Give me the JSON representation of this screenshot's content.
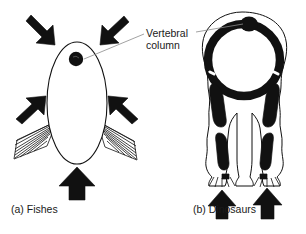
{
  "figure": {
    "background_color": "#ffffff",
    "ink_color": "#111111",
    "leader_line_color": "#7a7a7a",
    "annotation": {
      "name": "vertebral-column-label",
      "line1": "Vertebral",
      "line2": "column"
    },
    "panels": [
      {
        "id": "a",
        "caption": "(a) Fishes",
        "subject": "fish-cross-section",
        "body_shape": "ellipse-outline",
        "vertebral_column_marker": "filled-circle",
        "fins": [
          "left-pectoral-fin",
          "right-pectoral-fin"
        ],
        "force_arrows": [
          {
            "name": "arrow-top-left",
            "direction": "down-right",
            "fill": "#111111"
          },
          {
            "name": "arrow-top-right",
            "direction": "down-left",
            "fill": "#111111"
          },
          {
            "name": "arrow-mid-left",
            "direction": "up-right",
            "fill": "#111111"
          },
          {
            "name": "arrow-mid-right",
            "direction": "up-left",
            "fill": "#111111"
          },
          {
            "name": "arrow-bottom-center",
            "direction": "up",
            "fill": "#111111"
          }
        ]
      },
      {
        "id": "b",
        "caption": "(b) Dinosaurs",
        "subject": "dinosaur-front-view",
        "body_shape": "wavy-outline-with-thick-ring",
        "vertebral_column_marker": "filled-blob-top-of-ring",
        "limbs": [
          "left-leg",
          "right-leg"
        ],
        "feet": [
          "left-foot",
          "right-foot"
        ],
        "force_arrows": [
          {
            "name": "arrow-under-left-foot",
            "direction": "up",
            "fill": "#111111"
          },
          {
            "name": "arrow-under-right-foot",
            "direction": "up",
            "fill": "#111111"
          }
        ]
      }
    ]
  }
}
